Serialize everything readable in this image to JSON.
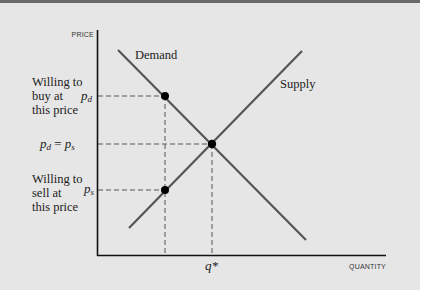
{
  "diagram": {
    "type": "supply-demand",
    "axes": {
      "y_label": "PRICE",
      "x_label": "QUANTITY"
    },
    "curves": {
      "demand_label": "Demand",
      "supply_label": "Supply"
    },
    "price_labels": {
      "pd": "p",
      "pd_sub": "d",
      "eq_left": "p",
      "eq_left_sub": "d",
      "eq_mid": " = ",
      "eq_right": "p",
      "eq_right_sub": "s",
      "ps": "p",
      "ps_sub": "s"
    },
    "quantity_label": "q*",
    "annotations": {
      "buy": [
        "Willing to",
        "buy at",
        "this price"
      ],
      "sell": [
        "Willing to",
        "sell at",
        "this price"
      ]
    },
    "colors": {
      "background": "#e6e6e6",
      "curve": "#555555",
      "axis": "#111111",
      "dashed": "#555555",
      "dot": "#000000",
      "top_rule": "#6a6a6a"
    }
  }
}
